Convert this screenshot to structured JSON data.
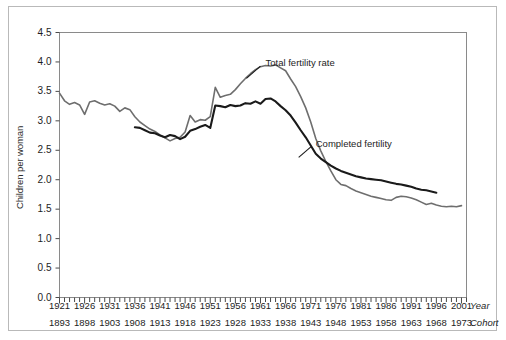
{
  "chart_data": {
    "type": "line",
    "title": "",
    "xlabel": "Year",
    "ylabel": "Children per woman",
    "secondary_xlabel": "Cohort",
    "ylim": [
      0.0,
      4.5
    ],
    "xlim": [
      1921,
      2002
    ],
    "grid": false,
    "legend_position": "inline-annotation",
    "ytick_labels": [
      "0.0",
      "0.5",
      "1.0",
      "1.5",
      "2.0",
      "2.5",
      "3.0",
      "3.5",
      "4.0",
      "4.5"
    ],
    "ytick_values": [
      0.0,
      0.5,
      1.0,
      1.5,
      2.0,
      2.5,
      3.0,
      3.5,
      4.0,
      4.5
    ],
    "xtick_labels_year": [
      "1921",
      "1926",
      "1931",
      "1936",
      "1941",
      "1946",
      "1951",
      "1956",
      "1961",
      "1966",
      "1971",
      "1976",
      "1981",
      "1986",
      "1991",
      "1996",
      "2001"
    ],
    "xtick_labels_cohort": [
      "1893",
      "1898",
      "1903",
      "1908",
      "1913",
      "1918",
      "1923",
      "1928",
      "1933",
      "1938",
      "1943",
      "1948",
      "1953",
      "1958",
      "1963",
      "1968",
      "1973"
    ],
    "xtick_values": [
      1921,
      1926,
      1931,
      1936,
      1941,
      1946,
      1951,
      1956,
      1961,
      1966,
      1971,
      1976,
      1981,
      1986,
      1991,
      1996,
      2001
    ],
    "minor_tick_interval": 1,
    "series": [
      {
        "name": "Total fertility rate",
        "color": "#6e6e6e",
        "width": 1.6,
        "x_start": 1921,
        "x": [
          1921,
          1922,
          1923,
          1924,
          1925,
          1926,
          1927,
          1928,
          1929,
          1930,
          1931,
          1932,
          1933,
          1934,
          1935,
          1936,
          1937,
          1938,
          1939,
          1940,
          1941,
          1942,
          1943,
          1944,
          1945,
          1946,
          1947,
          1948,
          1949,
          1950,
          1951,
          1952,
          1953,
          1954,
          1955,
          1956,
          1957,
          1958,
          1959,
          1960,
          1961,
          1962,
          1963,
          1964,
          1965,
          1966,
          1967,
          1968,
          1969,
          1970,
          1971,
          1972,
          1973,
          1974,
          1975,
          1976,
          1977,
          1978,
          1979,
          1980,
          1981,
          1982,
          1983,
          1984,
          1985,
          1986,
          1987,
          1988,
          1989,
          1990,
          1991,
          1992,
          1993,
          1994,
          1995,
          1996,
          1997,
          1998,
          1999,
          2000,
          2001
        ],
        "values": [
          3.47,
          3.34,
          3.28,
          3.31,
          3.27,
          3.11,
          3.32,
          3.34,
          3.3,
          3.27,
          3.29,
          3.25,
          3.16,
          3.22,
          3.19,
          3.07,
          2.98,
          2.92,
          2.86,
          2.82,
          2.76,
          2.71,
          2.66,
          2.7,
          2.72,
          2.81,
          3.09,
          2.98,
          3.02,
          3.01,
          3.07,
          3.57,
          3.4,
          3.43,
          3.45,
          3.53,
          3.63,
          3.72,
          3.8,
          3.87,
          3.92,
          3.94,
          3.93,
          3.95,
          3.9,
          3.85,
          3.71,
          3.58,
          3.41,
          3.22,
          2.98,
          2.7,
          2.49,
          2.31,
          2.15,
          2.0,
          1.92,
          1.9,
          1.85,
          1.81,
          1.78,
          1.75,
          1.72,
          1.7,
          1.68,
          1.66,
          1.65,
          1.7,
          1.72,
          1.71,
          1.69,
          1.66,
          1.62,
          1.58,
          1.6,
          1.57,
          1.55,
          1.54,
          1.55,
          1.54,
          1.56
        ]
      },
      {
        "name": "Completed fertility",
        "color": "#1a1a1a",
        "width": 2.1,
        "x_start": 1936,
        "x": [
          1936,
          1937,
          1938,
          1939,
          1940,
          1941,
          1942,
          1943,
          1944,
          1945,
          1946,
          1947,
          1948,
          1949,
          1950,
          1951,
          1952,
          1953,
          1954,
          1955,
          1956,
          1957,
          1958,
          1959,
          1960,
          1961,
          1962,
          1963,
          1964,
          1965,
          1966,
          1967,
          1968,
          1969,
          1970,
          1971,
          1972,
          1973,
          1974,
          1975,
          1976,
          1977,
          1978,
          1979,
          1980,
          1981,
          1982,
          1983,
          1984,
          1985,
          1986,
          1987,
          1988,
          1989,
          1990,
          1991,
          1992,
          1993,
          1994,
          1995,
          1996
        ],
        "values": [
          2.89,
          2.88,
          2.84,
          2.8,
          2.79,
          2.75,
          2.72,
          2.76,
          2.74,
          2.69,
          2.73,
          2.83,
          2.86,
          2.9,
          2.93,
          2.88,
          3.26,
          3.25,
          3.23,
          3.27,
          3.25,
          3.26,
          3.3,
          3.29,
          3.33,
          3.29,
          3.37,
          3.38,
          3.33,
          3.25,
          3.18,
          3.09,
          2.97,
          2.84,
          2.72,
          2.58,
          2.44,
          2.36,
          2.3,
          2.24,
          2.19,
          2.15,
          2.12,
          2.09,
          2.06,
          2.04,
          2.02,
          2.01,
          2.0,
          1.99,
          1.97,
          1.95,
          1.93,
          1.92,
          1.9,
          1.88,
          1.85,
          1.83,
          1.82,
          1.8,
          1.78
        ]
      }
    ],
    "annotations": [
      {
        "text": "Total fertility rate",
        "x": 1962,
        "y": 3.98
      },
      {
        "text": "Completed fertility",
        "x": 1972,
        "y": 2.6
      }
    ]
  }
}
